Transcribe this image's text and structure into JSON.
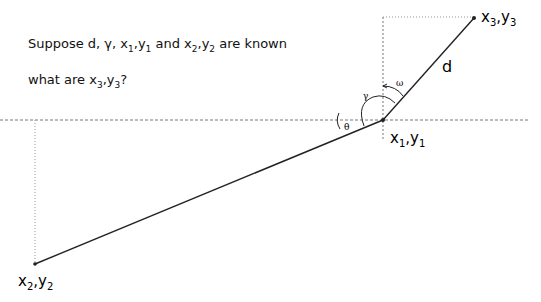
{
  "question": {
    "line1": {
      "prefix": "Suppose d, γ, ",
      "x1": "x",
      "s1": "1",
      "y1": "y",
      "t1": "1",
      "mid": " and ",
      "x2": "x",
      "s2": "2",
      "y2": "y",
      "t2": "2",
      "suffix": " are known"
    },
    "line2": {
      "prefix": "what are ",
      "x3": "x",
      "s3": "3",
      "y3": "y",
      "t3": "3",
      "suffix": "?"
    }
  },
  "diagram": {
    "points": {
      "p1": {
        "label_x": "x",
        "sub_x": "1",
        "label_y": "y",
        "sub_y": "1",
        "sep": ","
      },
      "p2": {
        "label_x": "x",
        "sub_x": "2",
        "label_y": "y",
        "sub_y": "2",
        "sep": ","
      },
      "p3": {
        "label_x": "x",
        "sub_x": "3",
        "label_y": "y",
        "sub_y": "3",
        "sep": ","
      }
    },
    "segment_label": "d",
    "angles": {
      "theta": "θ",
      "gamma": "γ",
      "omega": "ω"
    }
  }
}
